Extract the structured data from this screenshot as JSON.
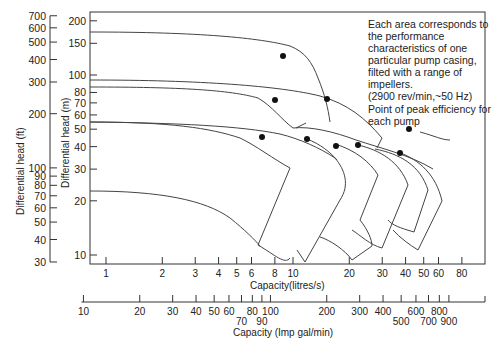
{
  "chart_data": {
    "type": "line",
    "title": "",
    "yaxis_ft": {
      "label": "Differential head (ft)",
      "ticks": [
        30,
        40,
        50,
        60,
        70,
        80,
        90,
        100,
        200,
        300,
        400,
        500,
        600,
        700
      ]
    },
    "yaxis_m": {
      "label": "Differential head (m)",
      "ticks": [
        10,
        20,
        30,
        40,
        50,
        60,
        70,
        80,
        100,
        150,
        200
      ]
    },
    "xaxis_ls": {
      "label": "Capacity(litres/s)",
      "ticks": [
        1,
        2,
        3,
        4,
        5,
        6,
        8,
        10,
        20,
        30,
        40,
        50,
        60,
        80
      ]
    },
    "xaxis_gal": {
      "label": "Capacity (Imp gal/min)",
      "ticks_top": [
        10,
        20,
        30,
        40,
        50,
        60,
        80,
        100,
        200,
        300,
        400,
        600,
        800
      ],
      "ticks_bottom": [
        70,
        90,
        500,
        700,
        900
      ]
    },
    "annotation": "Each area corresponds to the performance characteristics of one particular pump casing, filted with a range of impellers.",
    "annotation_speed": "(2900 rev/min,~50 Hz)",
    "legend": "Point of peak efficiency for each pump",
    "peak_efficiency_points_m": [
      {
        "q_ls": 8.5,
        "h_m": 128
      },
      {
        "q_ls": 7.8,
        "h_m": 76
      },
      {
        "q_ls": 15.5,
        "h_m": 78
      },
      {
        "q_ls": 6.0,
        "h_m": 49
      },
      {
        "q_ls": 12.5,
        "h_m": 47
      },
      {
        "q_ls": 18.5,
        "h_m": 44
      },
      {
        "q_ls": 24.5,
        "h_m": 44
      },
      {
        "q_ls": 38,
        "h_m": 38
      },
      {
        "q_ls": 42,
        "h_m": 54
      }
    ]
  },
  "labels": {
    "ylabel_ft": "Differential head (ft)",
    "ylabel_m": "Differential head (m)",
    "xlabel_ls": "Capacity(litres/s)",
    "xlabel_gal": "Capacity (Imp gal/min)",
    "note": "Each area corresponds to the performance characteristics of one particular pump casing, filted with a range of impellers.",
    "note_speed": "(2900 rev/min,~50 Hz)",
    "legend": "Point of peak efficiency for each pump"
  }
}
